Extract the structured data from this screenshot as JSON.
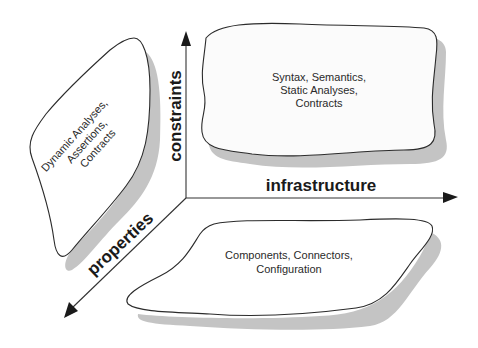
{
  "diagram": {
    "axes": {
      "vertical": {
        "label": "constraints"
      },
      "horizontal": {
        "label": "infrastructure"
      },
      "diagonal": {
        "label": "properties"
      }
    },
    "regions": {
      "top_right": {
        "lines": [
          "Syntax, Semantics,",
          "Static Analyses,",
          "Contracts"
        ]
      },
      "left": {
        "lines": [
          "Dynamic Analyses,",
          "Assertions,",
          "Contracts"
        ]
      },
      "bottom": {
        "lines": [
          "Components, Connectors,",
          "Configuration"
        ]
      }
    },
    "colors": {
      "background": "#ffffff",
      "shadow": "#c4c4c4",
      "outline": "#2b2b2b",
      "text": "#2a2a2a"
    }
  }
}
